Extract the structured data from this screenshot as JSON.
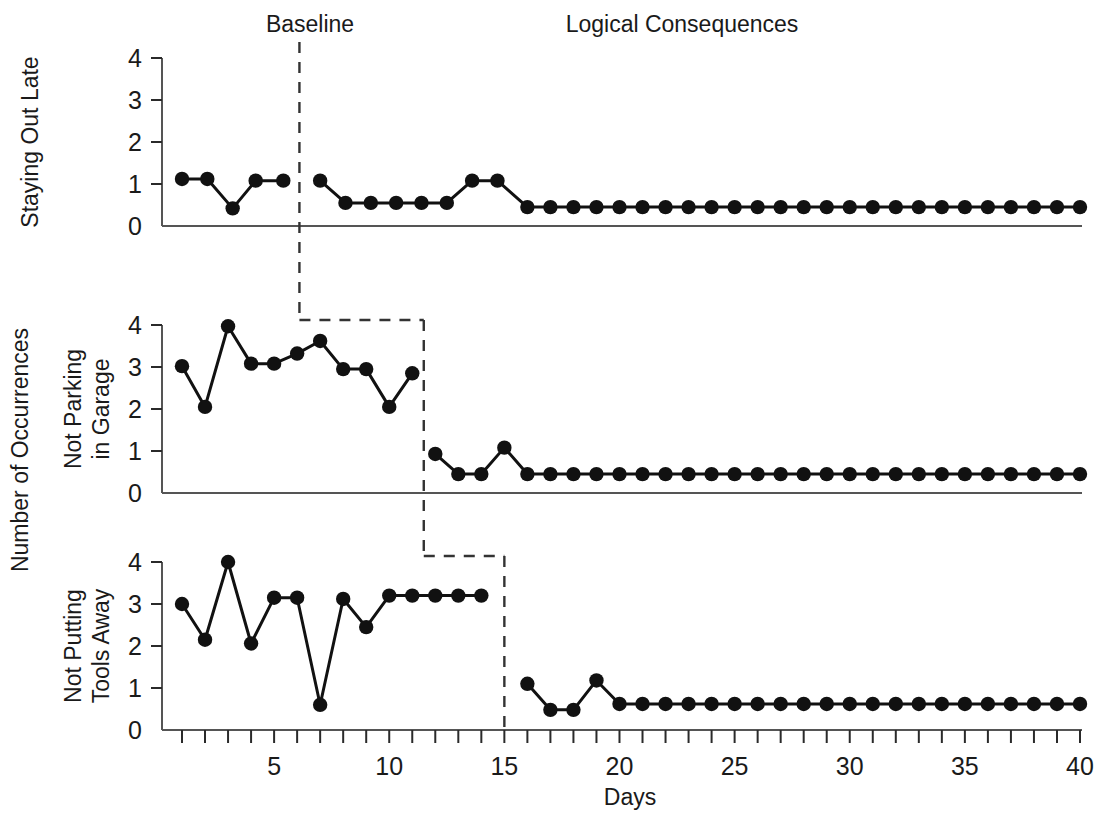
{
  "figure": {
    "title": "",
    "xlabel": "Days",
    "ylabel_overall": "Number of Occurrences",
    "phase_labels": {
      "baseline": "Baseline",
      "intervention": "Logical Consequences"
    },
    "colors": {
      "line": "#111111",
      "point": "#111111",
      "axis": "#555555",
      "divider": "#333333",
      "text": "#1a1a1a",
      "background": "#ffffff"
    }
  },
  "chart_data": {
    "type": "line",
    "title": "",
    "xlabel": "Days",
    "ylabel": "Number of Occurrences",
    "xlim": [
      0.2,
      40.5
    ],
    "ylim": [
      0,
      4
    ],
    "xticks": [
      1,
      2,
      3,
      4,
      5,
      6,
      7,
      8,
      9,
      10,
      11,
      12,
      13,
      14,
      15,
      16,
      17,
      18,
      19,
      20,
      21,
      22,
      23,
      24,
      25,
      26,
      27,
      28,
      29,
      30,
      31,
      32,
      33,
      34,
      35,
      36,
      37,
      38,
      39,
      40
    ],
    "xtick_labels_shown": [
      5,
      10,
      15,
      20,
      25,
      30,
      35,
      40
    ],
    "yticks": [
      0,
      1,
      2,
      3,
      4
    ],
    "grid": false,
    "legend": "none",
    "design": "multiple-baseline-across-behaviors",
    "phase_labels": [
      "Baseline",
      "Logical Consequences"
    ],
    "panels": [
      {
        "ylabel": "Staying Out Late",
        "phase_change_day": 6.1,
        "series": [
          {
            "name": "Baseline",
            "phase": "baseline",
            "x": [
              1.0,
              2.1,
              3.2,
              4.2,
              5.4
            ],
            "values": [
              1.12,
              1.12,
              0.42,
              1.08,
              1.08
            ]
          },
          {
            "name": "Logical Consequences",
            "phase": "intervention",
            "x": [
              7.0,
              8.1,
              9.2,
              10.3,
              11.4,
              12.5,
              13.6,
              14.7,
              16.0,
              17.0,
              18.0,
              19.0,
              20.0,
              21.0,
              22.0,
              23.0,
              24.0,
              25.0,
              26.0,
              27.0,
              28.0,
              29.0,
              30.0,
              31.0,
              32.0,
              33.0,
              34.0,
              35.0,
              36.0,
              37.0,
              38.0,
              39.0,
              40.0
            ],
            "values": [
              1.08,
              0.55,
              0.55,
              0.55,
              0.55,
              0.55,
              1.08,
              1.08,
              0.45,
              0.45,
              0.45,
              0.45,
              0.45,
              0.45,
              0.45,
              0.45,
              0.45,
              0.45,
              0.45,
              0.45,
              0.45,
              0.45,
              0.45,
              0.45,
              0.45,
              0.45,
              0.45,
              0.45,
              0.45,
              0.45,
              0.45,
              0.45,
              0.45
            ]
          }
        ]
      },
      {
        "ylabel": "Not Parking in Garage",
        "phase_change_day": 11.5,
        "series": [
          {
            "name": "Baseline",
            "phase": "baseline",
            "x": [
              1,
              2,
              3,
              4,
              5,
              6,
              7,
              8,
              9,
              10,
              11
            ],
            "values": [
              3.02,
              2.05,
              3.97,
              3.08,
              3.08,
              3.32,
              3.62,
              2.95,
              2.95,
              2.05,
              2.85
            ]
          },
          {
            "name": "Logical Consequences",
            "phase": "intervention",
            "x": [
              12,
              13,
              14,
              15,
              16,
              17,
              18,
              19,
              20,
              21,
              22,
              23,
              24,
              25,
              26,
              27,
              28,
              29,
              30,
              31,
              32,
              33,
              34,
              35,
              36,
              37,
              38,
              39,
              40
            ],
            "values": [
              0.93,
              0.45,
              0.45,
              1.08,
              0.45,
              0.45,
              0.45,
              0.45,
              0.45,
              0.45,
              0.45,
              0.45,
              0.45,
              0.45,
              0.45,
              0.45,
              0.45,
              0.45,
              0.45,
              0.45,
              0.45,
              0.45,
              0.45,
              0.45,
              0.45,
              0.45,
              0.45,
              0.45,
              0.45
            ]
          }
        ]
      },
      {
        "ylabel": "Not Putting Tools Away",
        "phase_change_day": 15.0,
        "series": [
          {
            "name": "Baseline",
            "phase": "baseline",
            "x": [
              1,
              2,
              3,
              4,
              5,
              6,
              7,
              8,
              9,
              10,
              11,
              12,
              13,
              14
            ],
            "values": [
              3.0,
              2.15,
              4.0,
              2.06,
              3.15,
              3.15,
              0.6,
              3.12,
              2.45,
              3.2,
              3.2,
              3.2,
              3.2,
              3.2
            ]
          },
          {
            "name": "Logical Consequences",
            "phase": "intervention",
            "x": [
              16,
              17,
              18,
              19,
              20,
              21,
              22,
              23,
              24,
              25,
              26,
              27,
              28,
              29,
              30,
              31,
              32,
              33,
              34,
              35,
              36,
              37,
              38,
              39,
              40
            ],
            "values": [
              1.1,
              0.48,
              0.48,
              1.18,
              0.62,
              0.62,
              0.62,
              0.62,
              0.62,
              0.62,
              0.62,
              0.62,
              0.62,
              0.62,
              0.62,
              0.62,
              0.62,
              0.62,
              0.62,
              0.62,
              0.62,
              0.62,
              0.62,
              0.62,
              0.62
            ]
          }
        ]
      }
    ]
  }
}
